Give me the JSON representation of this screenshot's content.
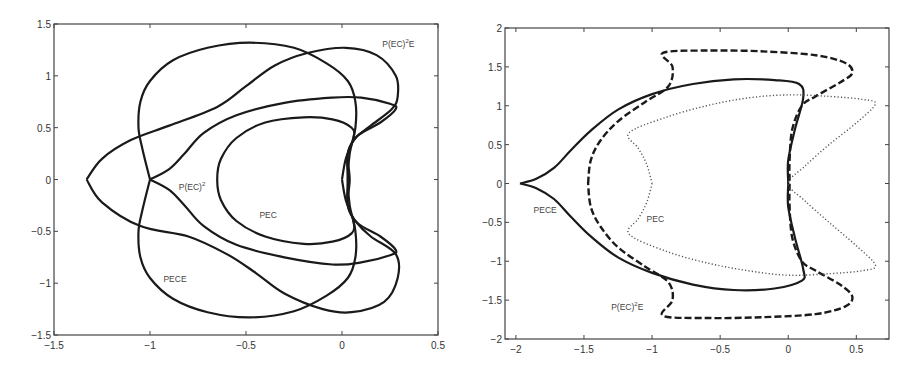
{
  "chart_data": [
    {
      "type": "line",
      "title": "",
      "xlabel": "",
      "ylabel": "",
      "xlim": [
        -1.5,
        0.5
      ],
      "ylim": [
        -1.5,
        1.5
      ],
      "grid": false,
      "legend": null,
      "xticks": [
        -1.5,
        -1,
        -0.5,
        0,
        0.5
      ],
      "xtick_labels": [
        "-1.5",
        "-1",
        "-0.5",
        "0",
        "0.5"
      ],
      "yticks": [
        -1.5,
        -1,
        -0.5,
        0,
        0.5,
        1,
        1.5
      ],
      "ytick_labels": [
        "-1.5",
        "-1",
        "-0.5",
        "0",
        "0.5",
        "1",
        "1.5"
      ],
      "annotations": [
        {
          "text": "P(EC)",
          "sup": "2",
          "suffix": "E",
          "x": 0.21,
          "y": 1.28
        },
        {
          "text": "P(EC)",
          "sup": "2",
          "suffix": "",
          "x": -0.85,
          "y": -0.1
        },
        {
          "text": "PEC",
          "sup": "",
          "suffix": "",
          "x": -0.43,
          "y": -0.37
        },
        {
          "text": "PECE",
          "sup": "",
          "suffix": "",
          "x": -0.93,
          "y": -0.99
        }
      ],
      "series": [
        {
          "name": "PEC",
          "style": "solid",
          "points": [
            [
              0.0,
              0.0
            ],
            [
              0.02,
              0.2
            ],
            [
              0.06,
              0.4
            ],
            [
              0.05,
              0.5
            ],
            [
              -0.05,
              0.58
            ],
            [
              -0.2,
              0.6
            ],
            [
              -0.4,
              0.55
            ],
            [
              -0.55,
              0.4
            ],
            [
              -0.63,
              0.2
            ],
            [
              -0.65,
              0.0
            ],
            [
              -0.63,
              -0.2
            ],
            [
              -0.55,
              -0.4
            ],
            [
              -0.4,
              -0.55
            ],
            [
              -0.2,
              -0.62
            ],
            [
              -0.05,
              -0.6
            ],
            [
              0.05,
              -0.52
            ],
            [
              0.06,
              -0.4
            ],
            [
              0.02,
              -0.2
            ],
            [
              0.0,
              0.0
            ]
          ]
        },
        {
          "name": "P(EC)^2",
          "style": "solid",
          "points": [
            [
              -1.0,
              0.0
            ],
            [
              -0.9,
              0.1
            ],
            [
              -0.82,
              0.25
            ],
            [
              -0.72,
              0.45
            ],
            [
              -0.55,
              0.62
            ],
            [
              -0.3,
              0.74
            ],
            [
              -0.05,
              0.79
            ],
            [
              0.1,
              0.79
            ],
            [
              0.25,
              0.73
            ],
            [
              0.28,
              0.68
            ],
            [
              0.2,
              0.55
            ],
            [
              0.08,
              0.42
            ],
            [
              0.03,
              0.25
            ],
            [
              0.03,
              0.0
            ],
            [
              0.03,
              -0.25
            ],
            [
              0.08,
              -0.42
            ],
            [
              0.2,
              -0.55
            ],
            [
              0.28,
              -0.68
            ],
            [
              0.25,
              -0.73
            ],
            [
              0.1,
              -0.8
            ],
            [
              -0.05,
              -0.82
            ],
            [
              -0.3,
              -0.75
            ],
            [
              -0.55,
              -0.63
            ],
            [
              -0.72,
              -0.45
            ],
            [
              -0.82,
              -0.25
            ],
            [
              -0.9,
              -0.1
            ],
            [
              -1.0,
              0.0
            ]
          ]
        },
        {
          "name": "PECE",
          "style": "solid",
          "points": [
            [
              -1.0,
              0.0
            ],
            [
              -1.04,
              0.3
            ],
            [
              -1.06,
              0.5
            ],
            [
              -1.05,
              0.75
            ],
            [
              -1.0,
              0.95
            ],
            [
              -0.88,
              1.15
            ],
            [
              -0.7,
              1.27
            ],
            [
              -0.48,
              1.32
            ],
            [
              -0.25,
              1.27
            ],
            [
              -0.08,
              1.12
            ],
            [
              0.03,
              0.95
            ],
            [
              0.07,
              0.75
            ],
            [
              0.07,
              0.5
            ],
            [
              0.04,
              0.25
            ],
            [
              0.03,
              0.0
            ],
            [
              0.04,
              -0.25
            ],
            [
              0.07,
              -0.5
            ],
            [
              0.07,
              -0.75
            ],
            [
              0.03,
              -0.95
            ],
            [
              -0.08,
              -1.12
            ],
            [
              -0.25,
              -1.27
            ],
            [
              -0.48,
              -1.33
            ],
            [
              -0.7,
              -1.28
            ],
            [
              -0.88,
              -1.15
            ],
            [
              -1.0,
              -0.95
            ],
            [
              -1.05,
              -0.75
            ],
            [
              -1.06,
              -0.5
            ],
            [
              -1.04,
              -0.3
            ],
            [
              -1.0,
              0.0
            ]
          ]
        },
        {
          "name": "P(EC)^2E",
          "style": "solid",
          "points": [
            [
              -1.33,
              0.0
            ],
            [
              -1.25,
              0.2
            ],
            [
              -1.1,
              0.38
            ],
            [
              -0.9,
              0.52
            ],
            [
              -0.65,
              0.7
            ],
            [
              -0.5,
              0.9
            ],
            [
              -0.35,
              1.1
            ],
            [
              -0.18,
              1.22
            ],
            [
              0.02,
              1.27
            ],
            [
              0.18,
              1.2
            ],
            [
              0.28,
              1.0
            ],
            [
              0.29,
              0.8
            ],
            [
              0.26,
              0.68
            ],
            [
              0.15,
              0.52
            ],
            [
              0.07,
              0.4
            ],
            [
              0.03,
              0.25
            ],
            [
              0.04,
              0.0
            ],
            [
              0.03,
              -0.25
            ],
            [
              0.07,
              -0.4
            ],
            [
              0.15,
              -0.55
            ],
            [
              0.28,
              -0.72
            ],
            [
              0.29,
              -0.95
            ],
            [
              0.22,
              -1.18
            ],
            [
              0.05,
              -1.28
            ],
            [
              -0.1,
              -1.25
            ],
            [
              -0.3,
              -1.1
            ],
            [
              -0.45,
              -0.9
            ],
            [
              -0.6,
              -0.72
            ],
            [
              -0.8,
              -0.55
            ],
            [
              -1.05,
              -0.45
            ],
            [
              -1.25,
              -0.22
            ],
            [
              -1.33,
              0.0
            ]
          ]
        }
      ]
    },
    {
      "type": "line",
      "title": "",
      "xlabel": "",
      "ylabel": "",
      "xlim": [
        -2.08,
        0.74
      ],
      "ylim": [
        -2,
        2
      ],
      "grid": false,
      "legend": null,
      "xticks": [
        -2,
        -1.5,
        -1,
        -0.5,
        0,
        0.5
      ],
      "xtick_labels": [
        "-2",
        "-1.5",
        "-1",
        "-0.5",
        "0",
        "0.5"
      ],
      "yticks": [
        -2,
        -1.5,
        -1,
        -0.5,
        0,
        0.5,
        1,
        1.5,
        2
      ],
      "ytick_labels": [
        "-2",
        "-1.5",
        "-1",
        "-0.5",
        "0",
        "0.5",
        "1",
        "1.5",
        "2"
      ],
      "annotations": [
        {
          "text": "PECE",
          "sup": "",
          "suffix": "",
          "x": -1.87,
          "y": -0.38
        },
        {
          "text": "PEC",
          "sup": "",
          "suffix": "",
          "x": -1.04,
          "y": -0.5
        },
        {
          "text": "P(EC)",
          "sup": "2",
          "suffix": "E",
          "x": -1.3,
          "y": -1.63
        }
      ],
      "series": [
        {
          "name": "PECE",
          "style": "solid",
          "points": [
            [
              -1.97,
              0.0
            ],
            [
              -1.85,
              0.06
            ],
            [
              -1.72,
              0.2
            ],
            [
              -1.6,
              0.42
            ],
            [
              -1.45,
              0.68
            ],
            [
              -1.25,
              0.95
            ],
            [
              -1.0,
              1.15
            ],
            [
              -0.7,
              1.28
            ],
            [
              -0.4,
              1.34
            ],
            [
              -0.1,
              1.33
            ],
            [
              0.08,
              1.28
            ],
            [
              0.11,
              1.1
            ],
            [
              0.05,
              0.7
            ],
            [
              0.0,
              0.3
            ],
            [
              0.0,
              0.0
            ],
            [
              0.0,
              -0.3
            ],
            [
              0.05,
              -0.7
            ],
            [
              0.11,
              -1.1
            ],
            [
              0.1,
              -1.25
            ],
            [
              -0.1,
              -1.35
            ],
            [
              -0.4,
              -1.37
            ],
            [
              -0.7,
              -1.3
            ],
            [
              -1.0,
              -1.15
            ],
            [
              -1.25,
              -0.95
            ],
            [
              -1.45,
              -0.68
            ],
            [
              -1.6,
              -0.42
            ],
            [
              -1.72,
              -0.2
            ],
            [
              -1.85,
              -0.06
            ],
            [
              -1.97,
              0.0
            ]
          ]
        },
        {
          "name": "P(EC)^2E",
          "style": "dashed",
          "points": [
            [
              -1.47,
              0.0
            ],
            [
              -1.45,
              0.3
            ],
            [
              -1.38,
              0.55
            ],
            [
              -1.25,
              0.8
            ],
            [
              -1.05,
              1.05
            ],
            [
              -0.88,
              1.25
            ],
            [
              -0.85,
              1.5
            ],
            [
              -0.92,
              1.68
            ],
            [
              -0.6,
              1.71
            ],
            [
              -0.2,
              1.7
            ],
            [
              0.2,
              1.65
            ],
            [
              0.42,
              1.55
            ],
            [
              0.47,
              1.42
            ],
            [
              0.38,
              1.3
            ],
            [
              0.2,
              1.12
            ],
            [
              0.1,
              1.0
            ],
            [
              0.03,
              0.7
            ],
            [
              0.01,
              0.3
            ],
            [
              0.01,
              0.0
            ],
            [
              0.01,
              -0.3
            ],
            [
              0.03,
              -0.7
            ],
            [
              0.1,
              -1.0
            ],
            [
              0.2,
              -1.12
            ],
            [
              0.38,
              -1.3
            ],
            [
              0.47,
              -1.45
            ],
            [
              0.42,
              -1.58
            ],
            [
              0.2,
              -1.68
            ],
            [
              -0.2,
              -1.72
            ],
            [
              -0.6,
              -1.73
            ],
            [
              -0.92,
              -1.7
            ],
            [
              -0.85,
              -1.5
            ],
            [
              -0.88,
              -1.27
            ],
            [
              -1.05,
              -1.07
            ],
            [
              -1.25,
              -0.82
            ],
            [
              -1.38,
              -0.55
            ],
            [
              -1.45,
              -0.3
            ],
            [
              -1.47,
              0.0
            ]
          ]
        },
        {
          "name": "PEC",
          "style": "dotted",
          "points": [
            [
              -1.0,
              0.0
            ],
            [
              -1.04,
              0.25
            ],
            [
              -1.1,
              0.45
            ],
            [
              -1.17,
              0.65
            ],
            [
              -0.9,
              0.85
            ],
            [
              -0.6,
              1.0
            ],
            [
              -0.3,
              1.1
            ],
            [
              0.0,
              1.14
            ],
            [
              0.3,
              1.12
            ],
            [
              0.55,
              1.08
            ],
            [
              0.64,
              1.02
            ],
            [
              0.5,
              0.78
            ],
            [
              0.3,
              0.5
            ],
            [
              0.12,
              0.22
            ],
            [
              0.0,
              0.0
            ],
            [
              0.12,
              -0.22
            ],
            [
              0.3,
              -0.5
            ],
            [
              0.5,
              -0.8
            ],
            [
              0.64,
              -1.05
            ],
            [
              0.55,
              -1.12
            ],
            [
              0.3,
              -1.16
            ],
            [
              0.0,
              -1.18
            ],
            [
              -0.3,
              -1.12
            ],
            [
              -0.6,
              -1.02
            ],
            [
              -0.9,
              -0.87
            ],
            [
              -1.17,
              -0.65
            ],
            [
              -1.1,
              -0.45
            ],
            [
              -1.04,
              -0.25
            ],
            [
              -1.0,
              0.0
            ]
          ]
        }
      ]
    }
  ],
  "plots": [
    {
      "box": {
        "left": 54,
        "top": 24,
        "right": 438,
        "bottom": 335
      }
    },
    {
      "box": {
        "left": 505,
        "top": 28,
        "right": 889,
        "bottom": 339
      }
    }
  ]
}
